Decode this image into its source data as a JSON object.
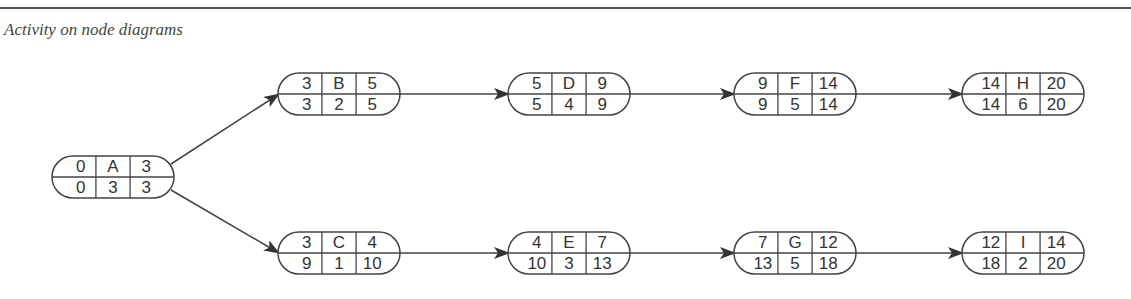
{
  "header": {
    "title": "Activity on node diagrams"
  },
  "diagram": {
    "type": "activity-on-node",
    "cell_layout": "top row: earliest start | activity | earliest finish; bottom row: latest start | duration | latest finish",
    "nodes": [
      {
        "id": "A",
        "es": "0",
        "ef": "3",
        "ls": "0",
        "dur": "3",
        "lf": "3",
        "x": 52,
        "y": 156
      },
      {
        "id": "B",
        "es": "3",
        "ef": "5",
        "ls": "3",
        "dur": "2",
        "lf": "5",
        "x": 278,
        "y": 73
      },
      {
        "id": "C",
        "es": "3",
        "ef": "4",
        "ls": "9",
        "dur": "1",
        "lf": "10",
        "x": 278,
        "y": 232
      },
      {
        "id": "D",
        "es": "5",
        "ef": "9",
        "ls": "5",
        "dur": "4",
        "lf": "9",
        "x": 508,
        "y": 73
      },
      {
        "id": "E",
        "es": "4",
        "ef": "7",
        "ls": "10",
        "dur": "3",
        "lf": "13",
        "x": 508,
        "y": 232
      },
      {
        "id": "F",
        "es": "9",
        "ef": "14",
        "ls": "9",
        "dur": "5",
        "lf": "14",
        "x": 734,
        "y": 73
      },
      {
        "id": "G",
        "es": "7",
        "ef": "12",
        "ls": "13",
        "dur": "5",
        "lf": "18",
        "x": 734,
        "y": 232
      },
      {
        "id": "H",
        "es": "14",
        "ef": "20",
        "ls": "14",
        "dur": "6",
        "lf": "20",
        "x": 962,
        "y": 73
      },
      {
        "id": "I",
        "es": "12",
        "ef": "14",
        "ls": "18",
        "dur": "2",
        "lf": "20",
        "x": 962,
        "y": 232
      }
    ],
    "edges": [
      {
        "from": "A",
        "to": "B"
      },
      {
        "from": "A",
        "to": "C"
      },
      {
        "from": "B",
        "to": "D"
      },
      {
        "from": "D",
        "to": "F"
      },
      {
        "from": "F",
        "to": "H"
      },
      {
        "from": "C",
        "to": "E"
      },
      {
        "from": "E",
        "to": "G"
      },
      {
        "from": "G",
        "to": "I"
      }
    ],
    "colors": {
      "line": "#444444",
      "text": "#333333",
      "background": "#ffffff"
    }
  }
}
